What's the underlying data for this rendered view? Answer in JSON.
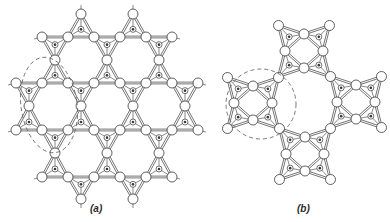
{
  "figure": {
    "panels": [
      {
        "id": "a",
        "label": "(a)",
        "description": "kagome-like network of corner-sharing tetrahedra",
        "lattice": {
          "edge": 26,
          "line_rows": [
            {
              "y": 37,
              "x_start": 42,
              "x_end": 172
            },
            {
              "y": 83,
              "x_start": 16,
              "x_end": 198
            },
            {
              "y": 130,
              "x_start": 16,
              "x_end": 198
            },
            {
              "y": 177,
              "x_start": 42,
              "x_end": 172
            }
          ],
          "apex_rows": [
            {
              "y": 14,
              "xs": [
                81,
                133
              ],
              "above": null,
              "below": 0
            },
            {
              "y": 60,
              "xs": [
                55,
                107,
                159
              ],
              "above": 0,
              "below": 1
            },
            {
              "y": 106,
              "xs": [
                29,
                81,
                133,
                185
              ],
              "above": 1,
              "below": 2
            },
            {
              "y": 153,
              "xs": [
                55,
                107,
                159
              ],
              "above": 2,
              "below": 3
            },
            {
              "y": 199,
              "xs": [
                81,
                133
              ],
              "above": 3,
              "below": null
            }
          ]
        },
        "highlight": {
          "shape": "ellipse",
          "cx": 49,
          "cy": 105,
          "rx": 28,
          "ry": 48,
          "rotate": -8
        }
      },
      {
        "id": "b",
        "label": "(b)",
        "description": "ring of four square tetrahedral clusters",
        "clusters": [
          {
            "name": "top",
            "cx": 304,
            "cy": 51
          },
          {
            "name": "left",
            "cx": 253,
            "cy": 103
          },
          {
            "name": "right",
            "cx": 356,
            "cy": 102
          },
          {
            "name": "bottom",
            "cx": 305,
            "cy": 154
          }
        ],
        "cluster_geometry": {
          "corner_offset": 25.5,
          "mid_offset": 19
        },
        "highlight": {
          "shape": "circle",
          "cx": 261,
          "cy": 104,
          "r": 35
        }
      }
    ],
    "style": {
      "stroke": "#3a3a3a",
      "sphere_fill": "#ffffff",
      "sphere_radius": 5,
      "dot_radius": 1.3,
      "dash_color": "#6a6a6a"
    }
  }
}
